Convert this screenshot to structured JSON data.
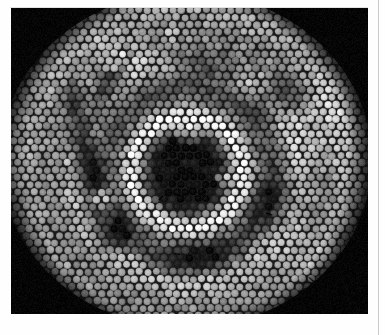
{
  "page": {
    "width": 385,
    "height": 335,
    "background_color": "#fefefe",
    "caption": "Grayscale micrograph of a hexagonally close-packed fiber bundle cross-section"
  },
  "rule": {
    "name": "right-page-rule",
    "x": 378,
    "color": "#c9c9c9",
    "width": 1
  },
  "plate": {
    "name": "photo-plate",
    "x": 11,
    "y": 8,
    "width": 357,
    "height": 306,
    "background_color": "#050505",
    "border_color": "#050505"
  },
  "image": {
    "type": "micrograph",
    "subject": "hexagonally close-packed circular fibers",
    "palette": {
      "black": "#050505",
      "core_dark": "#0d0d0d",
      "mid_dark": "#3a3a3a",
      "mid_gray": "#8a8a8a",
      "light_gray": "#b4b4b4",
      "bright": "#e2e2e2",
      "highlight": "#ffffff",
      "gap": "#1a1a1a"
    },
    "packing": {
      "lattice": "hexagonal",
      "cell_pitch": 8.4,
      "disc_radius": 3.7,
      "gap_width": 1.0
    },
    "field": {
      "center_x": 175,
      "center_y": 152,
      "outer_radius_x": 186,
      "outer_radius_y": 168,
      "edge_softness": 10
    },
    "core": {
      "name": "dark-core",
      "center_x": 176,
      "center_y": 164,
      "radius": 40,
      "value": 0.04,
      "softness": 8
    },
    "rings": [
      {
        "name": "bright-inner-annulus",
        "radius": 56,
        "thickness": 15,
        "delta": 0.42
      },
      {
        "name": "mid-dark-annulus",
        "radius": 84,
        "thickness": 22,
        "delta": -0.26
      },
      {
        "name": "faint-bright-annulus",
        "radius": 112,
        "thickness": 20,
        "delta": 0.14
      },
      {
        "name": "outer-dark-annulus",
        "radius": 140,
        "thickness": 26,
        "delta": -0.1
      }
    ],
    "streaks": [
      {
        "name": "left-radial-dark-band",
        "x": 74,
        "y": 150,
        "rx": 16,
        "ry": 86,
        "angle": -10,
        "delta": -0.55
      },
      {
        "name": "left-upper-dark-band",
        "x": 96,
        "y": 80,
        "rx": 14,
        "ry": 46,
        "angle": 28,
        "delta": -0.48
      },
      {
        "name": "upper-center-dark-band",
        "x": 196,
        "y": 56,
        "rx": 52,
        "ry": 19,
        "angle": 8,
        "delta": -0.42
      },
      {
        "name": "upper-right-dark-band",
        "x": 268,
        "y": 88,
        "rx": 32,
        "ry": 24,
        "angle": -22,
        "delta": -0.36
      },
      {
        "name": "right-dark-patch",
        "x": 262,
        "y": 196,
        "rx": 30,
        "ry": 34,
        "angle": 14,
        "delta": -0.32
      },
      {
        "name": "lower-center-dark-band",
        "x": 186,
        "y": 252,
        "rx": 58,
        "ry": 20,
        "angle": -6,
        "delta": -0.34
      },
      {
        "name": "lower-left-dark-band",
        "x": 104,
        "y": 226,
        "rx": 22,
        "ry": 30,
        "angle": 34,
        "delta": -0.38
      },
      {
        "name": "right-bright-patch",
        "x": 320,
        "y": 112,
        "rx": 42,
        "ry": 56,
        "angle": 0,
        "delta": 0.2
      },
      {
        "name": "upper-left-bright-patch",
        "x": 108,
        "y": 44,
        "rx": 34,
        "ry": 26,
        "angle": -14,
        "delta": 0.16
      },
      {
        "name": "lower-right-bright-patch",
        "x": 300,
        "y": 248,
        "rx": 46,
        "ry": 40,
        "angle": 10,
        "delta": 0.14
      }
    ],
    "highlights": [
      {
        "name": "core-top-white-cluster",
        "x": 178,
        "y": 116,
        "radius": 13,
        "value": 1.0
      },
      {
        "name": "left-white-pair",
        "x": 90,
        "y": 190,
        "radius": 9,
        "value": 0.98
      },
      {
        "name": "upper-left-white-spot",
        "x": 108,
        "y": 46,
        "radius": 7,
        "value": 0.95
      },
      {
        "name": "upper-left-white-spot-2",
        "x": 100,
        "y": 58,
        "radius": 6,
        "value": 0.92
      },
      {
        "name": "core-right-white-arc",
        "x": 214,
        "y": 170,
        "radius": 7,
        "value": 0.9
      },
      {
        "name": "upper-center-white-spot",
        "x": 160,
        "y": 24,
        "radius": 6,
        "value": 0.9
      },
      {
        "name": "right-white-spot",
        "x": 330,
        "y": 160,
        "radius": 5,
        "value": 0.88
      }
    ],
    "defects": [
      {
        "name": "defect-mark-lower-right-1",
        "x": 301,
        "y": 272,
        "length": 7,
        "angle": 40
      },
      {
        "name": "defect-mark-lower-right-2",
        "x": 292,
        "y": 282,
        "length": 6,
        "angle": -30
      },
      {
        "name": "defect-mark-mid-right",
        "x": 258,
        "y": 206,
        "length": 6,
        "angle": 20
      },
      {
        "name": "defect-mark-center",
        "x": 150,
        "y": 190,
        "length": 5,
        "angle": -45
      },
      {
        "name": "defect-mark-lower-center",
        "x": 166,
        "y": 246,
        "length": 5,
        "angle": 15
      }
    ]
  }
}
